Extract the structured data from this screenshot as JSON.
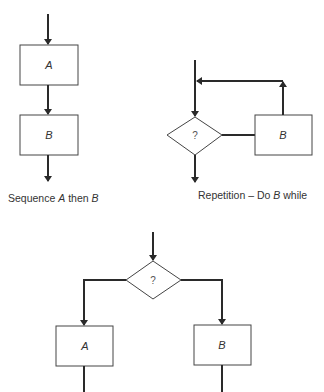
{
  "diagrams": {
    "sequence": {
      "caption_prefix": "Sequence ",
      "caption_a": "A",
      "caption_mid": " then ",
      "caption_b": "B",
      "box_a_label": "A",
      "box_b_label": "B"
    },
    "repetition": {
      "caption_prefix": "Repetition – Do ",
      "caption_b": "B",
      "caption_suffix": " while",
      "decision_label": "?",
      "box_b_label": "B"
    },
    "selection": {
      "decision_label": "?",
      "box_a_label": "A",
      "box_b_label": "B"
    }
  },
  "colors": {
    "line": "#2a2a2a",
    "box_stroke": "#444444",
    "background": "#ffffff"
  }
}
